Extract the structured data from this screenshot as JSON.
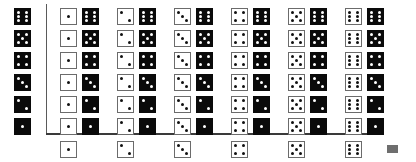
{
  "figure": {
    "type": "dice-pair-matrix",
    "grid": {
      "rows": 6,
      "cols": 6
    },
    "axes": {
      "y_axis_name": "black-die-value",
      "x_axis_name": "white-die-value",
      "y_axis_labels": [
        6,
        5,
        4,
        3,
        2,
        1
      ],
      "x_axis_labels": [
        1,
        2,
        3,
        4,
        5,
        6
      ],
      "y_axis_color": "#5a5a5a",
      "x_axis_color": "#3a3a3a"
    },
    "colors": {
      "white_die_face": "#ffffff",
      "white_die_border": "#6b6b6b",
      "white_die_pip": "#111111",
      "black_die_face": "#0a0a0a",
      "black_die_pip": "#ffffff",
      "corner_mark": "#6e6e6e",
      "background": "#ffffff"
    },
    "corner_mark_name": "resize-handle"
  },
  "chart_data": {
    "type": "table",
    "title": "",
    "xlabel": "white die",
    "ylabel": "black die",
    "x": [
      1,
      2,
      3,
      4,
      5,
      6
    ],
    "categories": [
      6,
      5,
      4,
      3,
      2,
      1
    ],
    "cells": [
      {
        "row": 6,
        "values": [
          {
            "white": 1,
            "black": 6
          },
          {
            "white": 2,
            "black": 6
          },
          {
            "white": 3,
            "black": 6
          },
          {
            "white": 4,
            "black": 6
          },
          {
            "white": 5,
            "black": 6
          },
          {
            "white": 6,
            "black": 6
          }
        ]
      },
      {
        "row": 5,
        "values": [
          {
            "white": 1,
            "black": 5
          },
          {
            "white": 2,
            "black": 5
          },
          {
            "white": 3,
            "black": 5
          },
          {
            "white": 4,
            "black": 5
          },
          {
            "white": 5,
            "black": 5
          },
          {
            "white": 6,
            "black": 5
          }
        ]
      },
      {
        "row": 4,
        "values": [
          {
            "white": 1,
            "black": 4
          },
          {
            "white": 2,
            "black": 4
          },
          {
            "white": 3,
            "black": 4
          },
          {
            "white": 4,
            "black": 4
          },
          {
            "white": 5,
            "black": 4
          },
          {
            "white": 6,
            "black": 4
          }
        ]
      },
      {
        "row": 3,
        "values": [
          {
            "white": 1,
            "black": 3
          },
          {
            "white": 2,
            "black": 3
          },
          {
            "white": 3,
            "black": 3
          },
          {
            "white": 4,
            "black": 3
          },
          {
            "white": 5,
            "black": 3
          },
          {
            "white": 6,
            "black": 3
          }
        ]
      },
      {
        "row": 2,
        "values": [
          {
            "white": 1,
            "black": 2
          },
          {
            "white": 2,
            "black": 2
          },
          {
            "white": 3,
            "black": 2
          },
          {
            "white": 4,
            "black": 2
          },
          {
            "white": 5,
            "black": 2
          },
          {
            "white": 6,
            "black": 2
          }
        ]
      },
      {
        "row": 1,
        "values": [
          {
            "white": 1,
            "black": 1
          },
          {
            "white": 2,
            "black": 1
          },
          {
            "white": 3,
            "black": 1
          },
          {
            "white": 4,
            "black": 1
          },
          {
            "white": 5,
            "black": 1
          },
          {
            "white": 6,
            "black": 1
          }
        ]
      }
    ]
  },
  "layout": {
    "cell_x": [
      60,
      117,
      174,
      231,
      288,
      345
    ],
    "cell_y": [
      8,
      30,
      52,
      74,
      96,
      118
    ],
    "row_label_x": 14,
    "col_label_y": 141,
    "axis_y": {
      "left": 46,
      "top": 4,
      "width": 1,
      "height": 130
    },
    "axis_x": {
      "left": 46,
      "top": 133,
      "width": 338,
      "height": 2
    },
    "corner_mark": {
      "left": 387,
      "top": 145
    }
  }
}
